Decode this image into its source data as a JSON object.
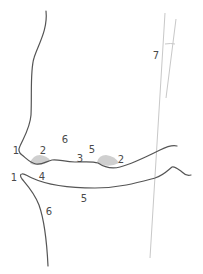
{
  "diagram": {
    "type": "anatomical-line-diagram",
    "colors": {
      "outline": "#555555",
      "reference_line": "#c8c8c8",
      "shaded_region": "#cfcfcf",
      "label": "#4a4a4a",
      "background": "#ffffff"
    },
    "labels": [
      {
        "id": "upper-1",
        "text": "1",
        "x": 16,
        "y": 151
      },
      {
        "id": "upper-2a",
        "text": "2",
        "x": 43,
        "y": 151
      },
      {
        "id": "upper-6",
        "text": "6",
        "x": 65,
        "y": 140
      },
      {
        "id": "upper-3",
        "text": "3",
        "x": 80,
        "y": 159
      },
      {
        "id": "upper-5",
        "text": "5",
        "x": 92,
        "y": 150
      },
      {
        "id": "upper-2b",
        "text": "2",
        "x": 121,
        "y": 160
      },
      {
        "id": "lower-1",
        "text": "1",
        "x": 14,
        "y": 178
      },
      {
        "id": "lower-4",
        "text": "4",
        "x": 42,
        "y": 177
      },
      {
        "id": "lower-5",
        "text": "5",
        "x": 84,
        "y": 199
      },
      {
        "id": "lower-6",
        "text": "6",
        "x": 49,
        "y": 212
      },
      {
        "id": "angle-7",
        "text": "7",
        "x": 156,
        "y": 56
      }
    ],
    "shapes": {
      "upper_profile": "upper contour descending from top, curving out to point 1, then running right along the upper margin",
      "lower_profile": "lower contour from point 1 curving right along the lower margin, plus a descending line on the left",
      "reference_lines": "two nearly vertical thin grey lines forming a small angle (7) near the top right",
      "shaded_regions": "two grey semi-elliptical bumps (2) on the upper margin"
    }
  }
}
